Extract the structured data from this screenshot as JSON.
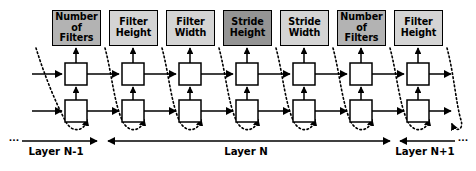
{
  "diagram": {
    "colors": {
      "stroke": "#000000",
      "background": "#ffffff",
      "cell_fill": "#ffffff",
      "shade_light": "#d4d4d4",
      "shade_medium": "#b3b3b3",
      "shade_dark": "#949494"
    },
    "param_boxes": [
      {
        "id": "number-of-filters-1",
        "line1": "Number",
        "line2": "of Filters",
        "shade": "#b3b3b3",
        "x": 52,
        "y": 10,
        "w": 49,
        "h": 36
      },
      {
        "id": "filter-height-1",
        "line1": "Filter",
        "line2": "Height",
        "shade": "#d4d4d4",
        "x": 109,
        "y": 10,
        "w": 49,
        "h": 36
      },
      {
        "id": "filter-width-1",
        "line1": "Filter",
        "line2": "Width",
        "shade": "#d4d4d4",
        "x": 166,
        "y": 10,
        "w": 49,
        "h": 36
      },
      {
        "id": "stride-height-1",
        "line1": "Stride",
        "line2": "Height",
        "shade": "#949494",
        "x": 223,
        "y": 10,
        "w": 49,
        "h": 36
      },
      {
        "id": "stride-width-1",
        "line1": "Stride",
        "line2": "Width",
        "shade": "#d4d4d4",
        "x": 280,
        "y": 10,
        "w": 49,
        "h": 36
      },
      {
        "id": "number-of-filters-2",
        "line1": "Number",
        "line2": "of Filters",
        "shade": "#b3b3b3",
        "x": 337,
        "y": 10,
        "w": 49,
        "h": 36
      },
      {
        "id": "filter-height-2",
        "line1": "Filter",
        "line2": "Height",
        "shade": "#d4d4d4",
        "x": 394,
        "y": 10,
        "w": 49,
        "h": 36
      }
    ],
    "cells": {
      "top_row_y": 63,
      "bottom_row_y": 100,
      "size": 22,
      "xs": [
        65,
        122,
        179,
        236,
        293,
        350,
        407
      ]
    },
    "layer_labels": [
      {
        "id": "layer-prev",
        "text": "Layer N-1",
        "cx": 56,
        "y": 152
      },
      {
        "id": "layer-current",
        "text": "Layer N",
        "cx": 246,
        "y": 152
      },
      {
        "id": "layer-next",
        "text": "Layer N+1",
        "cx": 425,
        "y": 152
      }
    ],
    "ellipsis": "..."
  }
}
